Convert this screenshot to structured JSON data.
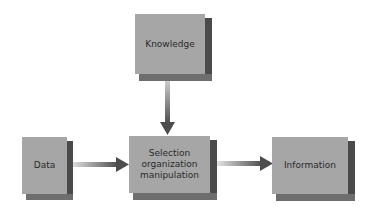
{
  "diagram": {
    "nodes": [
      {
        "id": "knowledge",
        "label": "Knowledge"
      },
      {
        "id": "data",
        "label": "Data"
      },
      {
        "id": "process",
        "label_lines": [
          "Selection",
          "organization",
          "manipulation"
        ]
      },
      {
        "id": "information",
        "label": "Information"
      }
    ],
    "edges": [
      {
        "from": "knowledge",
        "to": "process"
      },
      {
        "from": "data",
        "to": "process"
      },
      {
        "from": "process",
        "to": "information"
      }
    ],
    "colors": {
      "box_front": "#a6a6a6",
      "box_side": "#4a4a4a",
      "box_bottom": "#6e6e6e",
      "arrow": "#5a5a5a"
    }
  }
}
